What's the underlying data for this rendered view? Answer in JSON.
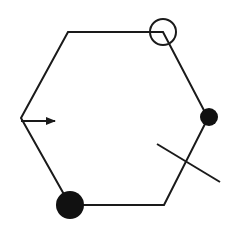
{
  "diagram": {
    "type": "hexagon-with-markers",
    "stroke_color": "#1a1a1a",
    "background": "#ffffff",
    "hexagon": {
      "points": "68,32 163,32 208,118 164,205 70,205 21,118"
    },
    "markers": {
      "open_circle": {
        "cx": 163,
        "cy": 32,
        "r": 13
      },
      "small_filled_circle": {
        "cx": 209,
        "cy": 117,
        "r": 9
      },
      "large_filled_circle": {
        "cx": 70,
        "cy": 205,
        "r": 14
      },
      "arrow": {
        "x1": 21,
        "y1": 121,
        "x2": 55,
        "y2": 121
      },
      "cross_line": {
        "x1": 157,
        "y1": 144,
        "x2": 220,
        "y2": 182
      }
    }
  }
}
